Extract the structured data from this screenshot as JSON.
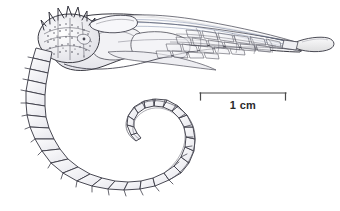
{
  "figure": {
    "subject_name": "seahorse-lateral-view",
    "background_color": "#ffffff",
    "ink_color": "#3a3a42",
    "ink_light_color": "#8b8b96",
    "ink_blue_color": "#6b7a9c",
    "shade_color": "#ececf0"
  },
  "scale_bar": {
    "label": "1 cm",
    "bar_color": "#4a4a4a",
    "x_start": 200,
    "x_end": 286,
    "y": 93,
    "tick_height": 7
  },
  "anatomy": {
    "coronet": "spiny-coronet",
    "head": "head",
    "snout": "snout",
    "trunk": "plated-trunk",
    "dorsal_fin": "dorsal-fin",
    "tail": "coiled-prehensile-tail",
    "tail_tip": "tail-tip"
  }
}
